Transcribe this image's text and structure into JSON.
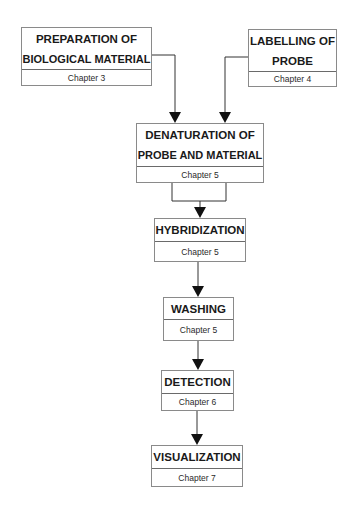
{
  "diagram": {
    "type": "flowchart",
    "nodes": [
      {
        "id": "prep",
        "title_lines": [
          "PREPARATION OF",
          "BIOLOGICAL MATERIAL"
        ],
        "chapter": "Chapter 3"
      },
      {
        "id": "label",
        "title_lines": [
          "LABELLING OF",
          "PROBE"
        ],
        "chapter": "Chapter 4"
      },
      {
        "id": "denat",
        "title_lines": [
          "DENATURATION OF",
          "PROBE AND MATERIAL"
        ],
        "chapter": "Chapter 5"
      },
      {
        "id": "hyb",
        "title_lines": [
          "HYBRIDIZATION"
        ],
        "chapter": "Chapter 5"
      },
      {
        "id": "wash",
        "title_lines": [
          "WASHING"
        ],
        "chapter": "Chapter 5"
      },
      {
        "id": "detect",
        "title_lines": [
          "DETECTION"
        ],
        "chapter": "Chapter 6"
      },
      {
        "id": "visual",
        "title_lines": [
          "VISUALIZATION"
        ],
        "chapter": "Chapter 7"
      }
    ],
    "edges": [
      {
        "from": "prep",
        "to": "denat"
      },
      {
        "from": "label",
        "to": "denat"
      },
      {
        "from": "denat",
        "to": "hyb"
      },
      {
        "from": "hyb",
        "to": "wash"
      },
      {
        "from": "wash",
        "to": "detect"
      },
      {
        "from": "detect",
        "to": "visual"
      }
    ],
    "colors": {
      "line": "#333333",
      "border": "#8a8a8a",
      "text": "#1a1a1a"
    }
  }
}
